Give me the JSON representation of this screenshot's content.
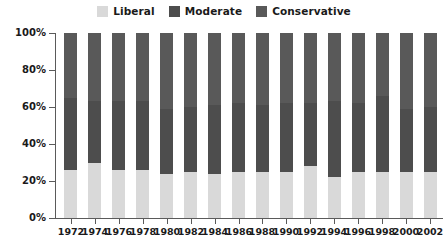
{
  "legend": {
    "items": [
      {
        "label": "Liberal",
        "color": "#d9d9d9",
        "key": "liberal"
      },
      {
        "label": "Moderate",
        "color": "#4d4d4d",
        "key": "moderate"
      },
      {
        "label": "Conservative",
        "color": "#595959",
        "key": "conservative"
      }
    ]
  },
  "chart_data": {
    "type": "bar",
    "stacked": true,
    "normalized": true,
    "title": "",
    "subtitle": "",
    "xlabel": "",
    "ylabel": "",
    "ylim": [
      0,
      100
    ],
    "yticks": [
      "0%",
      "20%",
      "40%",
      "60%",
      "80%",
      "100%"
    ],
    "ytick_values": [
      0,
      20,
      40,
      60,
      80,
      100
    ],
    "grid": false,
    "legend_position": "top-center",
    "categories": [
      "1972",
      "1974",
      "1976",
      "1978",
      "1980",
      "1982",
      "1984",
      "1986",
      "1988",
      "1990",
      "1992",
      "1994",
      "1996",
      "1998",
      "2000",
      "2002"
    ],
    "series": [
      {
        "name": "Liberal",
        "color": "#d9d9d9",
        "values": [
          26,
          30,
          26,
          26,
          24,
          25,
          24,
          25,
          25,
          25,
          28,
          22,
          25,
          25,
          25,
          25
        ]
      },
      {
        "name": "Moderate",
        "color": "#4d4d4d",
        "values": [
          39,
          33,
          37,
          37,
          35,
          35,
          37,
          37,
          36,
          37,
          34,
          41,
          37,
          41,
          34,
          35
        ]
      },
      {
        "name": "Conservative",
        "color": "#595959",
        "values": [
          35,
          37,
          37,
          37,
          41,
          40,
          39,
          38,
          39,
          38,
          38,
          37,
          38,
          34,
          41,
          40
        ]
      }
    ]
  }
}
